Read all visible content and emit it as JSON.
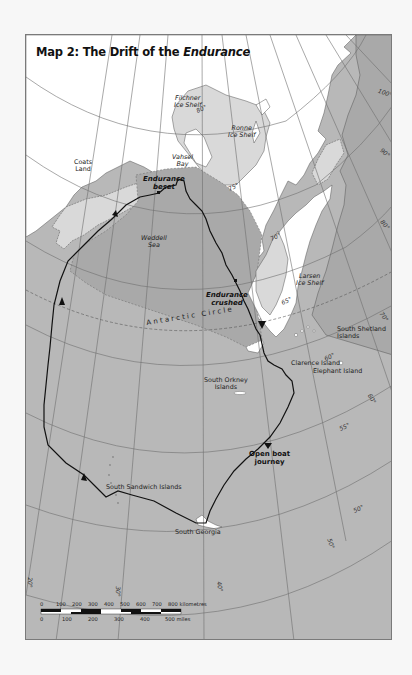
{
  "map": {
    "title_prefix": "Map 2: The Drift of the ",
    "title_italic": "Endurance",
    "regions": {
      "coats_land": [
        "Coats",
        "Land"
      ],
      "filchner": [
        "Filchner",
        "Ice Shelf"
      ],
      "ronne": [
        "Ronne",
        "Ice Shelf"
      ],
      "vahsel": [
        "Vahsel",
        "Bay"
      ],
      "weddell": [
        "Weddell",
        "Sea"
      ],
      "larsen": [
        "Larsen",
        "Ice Shelf"
      ],
      "south_shetland": [
        "South Shetland",
        "Islands"
      ],
      "south_orkney": [
        "South Orkney",
        "Islands"
      ],
      "clarence": "Clarence Island",
      "elephant": "Elephant Island",
      "south_sandwich": "South Sandwich Islands",
      "south_georgia": "South Georgia"
    },
    "events": {
      "beset": [
        "Endurance",
        "beset"
      ],
      "crushed": [
        "Endurance",
        "crushed"
      ],
      "open_boat": [
        "Open boat",
        "journey"
      ]
    },
    "antarctic_circle": "Antarctic Circle",
    "latitude_labels": [
      "80°",
      "75°",
      "70°",
      "65°",
      "60°",
      "55°",
      "50°"
    ],
    "longitude_labels": [
      "100°",
      "90°",
      "80°",
      "70°",
      "60°",
      "50°",
      "40°",
      "30°",
      "20°"
    ],
    "scale": {
      "km_ticks": [
        "0",
        "100",
        "200",
        "300",
        "400",
        "500",
        "600",
        "700",
        "800 kilometres"
      ],
      "mile_ticks": [
        "0",
        "100",
        "200",
        "300",
        "400",
        "500 miles"
      ]
    },
    "colors": {
      "sea": "#b8b8b8",
      "land": "#ffffff",
      "ice_shelf": "#d9d9d9",
      "dark_sea": "#a9a9a9",
      "route": "#111111",
      "grid": "#6e6e6e"
    }
  }
}
